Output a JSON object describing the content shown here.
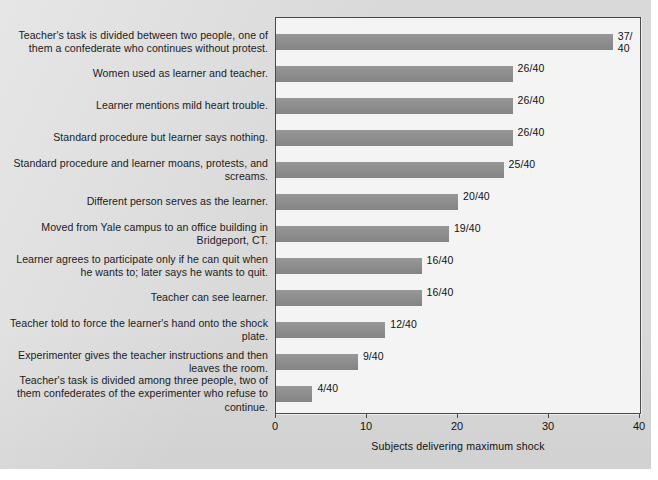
{
  "chart_data": {
    "type": "bar",
    "orientation": "horizontal",
    "title": "",
    "xlabel": "Subjects delivering maximum shock",
    "ylabel": "",
    "xlim": [
      0,
      40
    ],
    "xticks": [
      0,
      10,
      20,
      30,
      40
    ],
    "xtick_labels": [
      "0",
      "10",
      "20",
      "30",
      "40"
    ],
    "grid": false,
    "legend": "none",
    "denominator": 40,
    "bar_color": "#8b8b8b",
    "plot_background": "#f4f4f4",
    "figure_background": "#d9d9d9",
    "axis_color": "#4a4a4a",
    "categories": [
      "Teacher's task is divided between two people, one of them a confederate who continues without protest.",
      "Women used as learner and teacher.",
      "Learner mentions mild heart trouble.",
      "Standard procedure but learner says nothing.",
      "Standard procedure and learner moans, protests, and screams.",
      "Different person serves as the learner.",
      "Moved from Yale campus to an office building in Bridgeport, CT.",
      "Learner agrees to participate only if he can quit when he wants to; later says he wants to quit.",
      "Teacher can see learner.",
      "Teacher told to force the learner's hand onto the shock plate.",
      "Experimenter gives the teacher instructions and then leaves the room.",
      "Teacher's task is divided among three people, two of  them confederates of the experimenter who refuse to continue."
    ],
    "values": [
      37,
      26,
      26,
      26,
      25,
      20,
      19,
      16,
      16,
      12,
      9,
      4
    ],
    "value_labels": [
      "37/ 40",
      "26/40",
      "26/40",
      "26/40",
      "25/40",
      "20/40",
      "19/40",
      "16/40",
      "16/40",
      "12/40",
      "9/40",
      "4/40"
    ]
  }
}
